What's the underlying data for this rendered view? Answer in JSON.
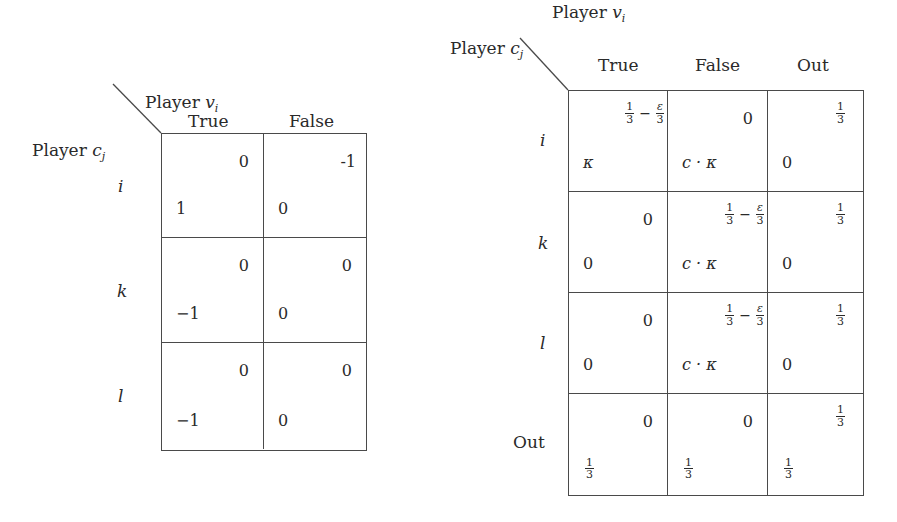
{
  "tables": [
    {
      "name": "game-table-two-choices",
      "row_player": "Player c_j",
      "row_player_label": {
        "text": "Player ",
        "var": "c",
        "sub": "j"
      },
      "col_player_label": {
        "text": "Player ",
        "var": "v",
        "sub": "i"
      },
      "columns": [
        "True",
        "False"
      ],
      "rows": [
        "i",
        "k",
        "l"
      ],
      "cells": [
        [
          {
            "top_right": "0",
            "bottom_left": "1"
          },
          {
            "top_right": "-1",
            "bottom_left": "0"
          }
        ],
        [
          {
            "top_right": "0",
            "bottom_left": "−1"
          },
          {
            "top_right": "0",
            "bottom_left": "0"
          }
        ],
        [
          {
            "top_right": "0",
            "bottom_left": "−1"
          },
          {
            "top_right": "0",
            "bottom_left": "0"
          }
        ]
      ]
    },
    {
      "name": "game-table-three-choices",
      "row_player_label": {
        "text": "Player ",
        "var": "c",
        "sub": "j"
      },
      "col_player_label": {
        "text": "Player ",
        "var": "v",
        "sub": "i"
      },
      "columns": [
        "True",
        "False",
        "Out"
      ],
      "rows": [
        "i",
        "k",
        "l",
        "Out"
      ],
      "cells": [
        [
          {
            "top_right": "1/3 − ε/3",
            "bottom_left": "κ"
          },
          {
            "top_right": "0",
            "bottom_left": "c · κ"
          },
          {
            "top_right": "1/3",
            "bottom_left": "0"
          }
        ],
        [
          {
            "top_right": "0",
            "bottom_left": "0"
          },
          {
            "top_right": "1/3 − ε/3",
            "bottom_left": "c · κ"
          },
          {
            "top_right": "1/3",
            "bottom_left": "0"
          }
        ],
        [
          {
            "top_right": "0",
            "bottom_left": "0"
          },
          {
            "top_right": "1/3 − ε/3",
            "bottom_left": "c · κ"
          },
          {
            "top_right": "1/3",
            "bottom_left": "0"
          }
        ],
        [
          {
            "top_right": "0",
            "bottom_left": "1/3"
          },
          {
            "top_right": "0",
            "bottom_left": "1/3"
          },
          {
            "top_right": "1/3",
            "bottom_left": "1/3"
          }
        ]
      ]
    }
  ],
  "symbols": {
    "one": "1",
    "three": "3",
    "minus": "−",
    "epsilon": "ε",
    "kappa": "κ",
    "c": "c",
    "dot": "·"
  }
}
